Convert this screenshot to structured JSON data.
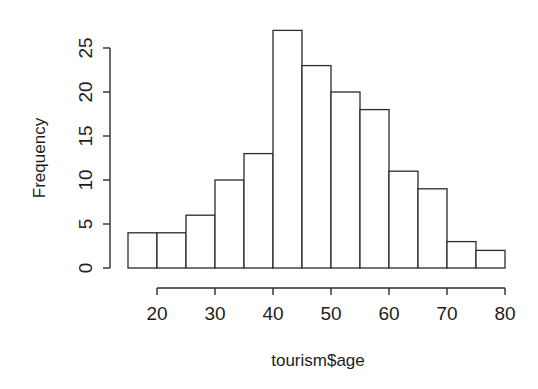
{
  "chart_data": {
    "type": "bar",
    "title": "",
    "subtitle": "",
    "xlabel": "tourism$age",
    "ylabel": "Frequency",
    "grid": false,
    "legend": "none",
    "bin_width": 5,
    "bin_edges": [
      15,
      20,
      25,
      30,
      35,
      40,
      45,
      50,
      55,
      60,
      65,
      70,
      75,
      80
    ],
    "categories": [
      "15-20",
      "20-25",
      "25-30",
      "30-35",
      "35-40",
      "40-45",
      "45-50",
      "50-55",
      "55-60",
      "60-65",
      "65-70",
      "70-75",
      "75-80"
    ],
    "values": [
      4,
      4,
      6,
      10,
      13,
      27,
      23,
      20,
      18,
      11,
      9,
      3,
      2
    ],
    "xlim": [
      15,
      80
    ],
    "ylim": [
      0,
      27
    ],
    "xticks": [
      20,
      30,
      40,
      50,
      60,
      70,
      80
    ],
    "xticklabels": [
      "20",
      "30",
      "40",
      "50",
      "60",
      "70",
      "80"
    ],
    "yticks": [
      0,
      5,
      10,
      15,
      20,
      25
    ],
    "yticklabels": [
      "0",
      "5",
      "10",
      "15",
      "20",
      "25"
    ],
    "bar_fill": "#ffffff",
    "bar_stroke": "#2b2b2b",
    "background": "#ffffff"
  },
  "axes": {
    "y_title": "Frequency",
    "x_title": "tourism$age",
    "y_labels": [
      "0",
      "5",
      "10",
      "15",
      "20",
      "25"
    ],
    "x_labels": [
      "20",
      "30",
      "40",
      "50",
      "60",
      "70",
      "80"
    ]
  }
}
